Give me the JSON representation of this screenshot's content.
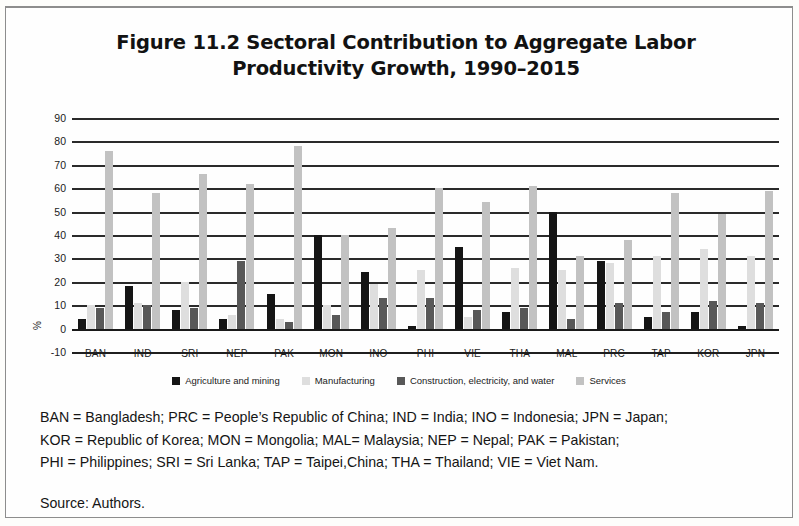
{
  "figure": {
    "title_line1": "Figure 11.2  Sectoral Contribution to Aggregate Labor",
    "title_line2": "Productivity Growth, 1990–2015"
  },
  "notes": {
    "line1": "BAN = Bangladesh; PRC = People’s Republic of China; IND = India; INO = Indonesia; JPN = Japan;",
    "line2": "KOR = Republic of Korea; MON = Mongolia; MAL= Malaysia; NEP = Nepal; PAK = Pakistan;",
    "line3": "PHI = Philippines; SRI = Sri Lanka; TAP = Taipei,China; THA = Thailand; VIE = Viet Nam.",
    "source": "Source: Authors."
  },
  "chart_data": {
    "type": "bar",
    "title": "Figure 11.2  Sectoral Contribution to Aggregate Labor Productivity Growth, 1990–2015",
    "xlabel": "",
    "ylabel": "%",
    "ylim": [
      -10,
      90
    ],
    "ytick_step": 10,
    "yticks": [
      90,
      80,
      70,
      60,
      50,
      40,
      30,
      20,
      10,
      0,
      -10
    ],
    "grid": true,
    "legend_position": "bottom",
    "categories": [
      "BAN",
      "IND",
      "SRI",
      "NEP",
      "PAK",
      "MON",
      "INO",
      "PHI",
      "VIE",
      "THA",
      "MAL",
      "PRC",
      "TAP",
      "KOR",
      "JPN"
    ],
    "series": [
      {
        "name": "Agriculture and mining",
        "color": "#151515",
        "values": [
          4,
          18,
          8,
          4,
          15,
          40,
          24,
          1,
          35,
          7,
          50,
          29,
          5,
          7,
          1
        ]
      },
      {
        "name": "Manufacturing",
        "color": "#dedede",
        "values": [
          10,
          11,
          20,
          6,
          4,
          10,
          19,
          25,
          5,
          26,
          25,
          28,
          31,
          34,
          31
        ]
      },
      {
        "name": "Construction, electricity, and water",
        "color": "#585858",
        "values": [
          9,
          10,
          9,
          29,
          3,
          6,
          13,
          13,
          8,
          9,
          4,
          11,
          7,
          12,
          11
        ]
      },
      {
        "name": "Services",
        "color": "#c2c2c2",
        "values": [
          76,
          58,
          66,
          62,
          78,
          40,
          43,
          60,
          54,
          61,
          31,
          38,
          58,
          49,
          59
        ]
      }
    ]
  }
}
